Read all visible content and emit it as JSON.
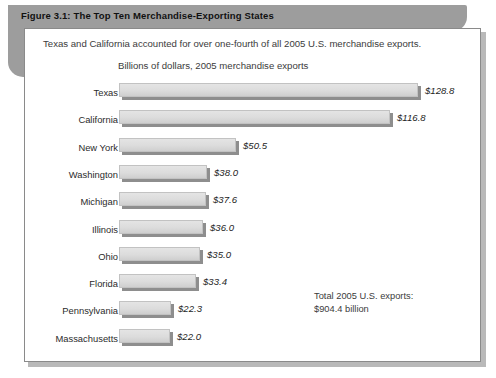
{
  "figure": {
    "title": "Figure 3.1: The Top Ten Merchandise-Exporting States",
    "subtitle": "Texas and California accounted for over one-fourth of all 2005 U.S. merchandise exports.",
    "axis_note": "Billions of dollars, 2005 merchandise exports",
    "total_note_line1": "Total 2005 U.S. exports:",
    "total_note_line2": "$904.4 billion",
    "colors": {
      "tab_gray": "#9d9d9d",
      "bar_fill": "#dcdcdc",
      "bar_shadow": "#8e8e8e",
      "panel_border": "#8a8a8a",
      "text": "#2b2b2b"
    }
  },
  "chart_data": {
    "type": "bar",
    "orientation": "horizontal",
    "title": "Figure 3.1: The Top Ten Merchandise-Exporting States",
    "subtitle": "Texas and California accounted for over one-fourth of all 2005 U.S. merchandise exports.",
    "xlabel": "Billions of dollars, 2005 merchandise exports",
    "ylabel": "",
    "xlim": [
      0,
      128.8
    ],
    "grid": false,
    "legend": false,
    "unit": "billions of U.S. dollars",
    "annotations": [
      "Total 2005 U.S. exports: $904.4 billion"
    ],
    "categories": [
      "Texas",
      "California",
      "New York",
      "Washington",
      "Michigan",
      "Illinois",
      "Ohio",
      "Florida",
      "Pennsylvania",
      "Massachusetts"
    ],
    "values": [
      128.8,
      116.8,
      50.5,
      38.0,
      37.6,
      36.0,
      35.0,
      33.4,
      22.3,
      22.0
    ],
    "data_labels": [
      "$128.8",
      "$116.8",
      "$50.5",
      "$38.0",
      "$37.6",
      "$36.0",
      "$35.0",
      "$33.4",
      "$22.3",
      "$22.0"
    ]
  }
}
